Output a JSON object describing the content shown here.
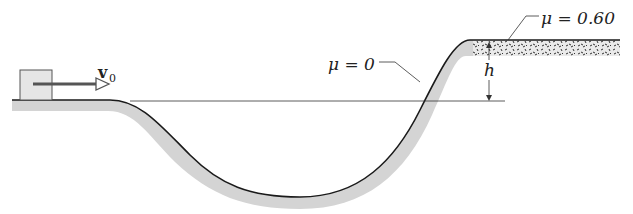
{
  "diagram": {
    "labels": {
      "velocity": "v",
      "velocity_sub": "0",
      "mu_frictionless": "μ = 0",
      "mu_rough": "μ = 0.60",
      "height": "h"
    },
    "colors": {
      "track_line": "#1a1a1a",
      "track_shadow": "#d4d4d4",
      "block_fill": "#e6e6e6",
      "arrow": "#555555",
      "rough_surface": "#3a3a3a"
    }
  }
}
